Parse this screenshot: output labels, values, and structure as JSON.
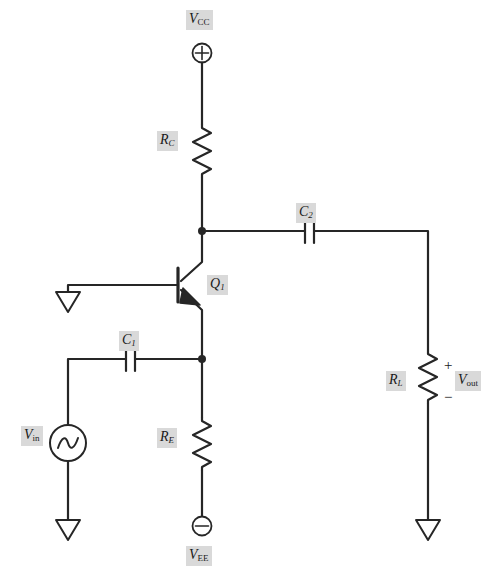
{
  "diagram": {
    "background_color": "#ffffff",
    "wire_color": "#262626",
    "label_background_color": "#d9d9d9",
    "label_text_color": "#1a1a1a"
  },
  "labels": {
    "vcc": "V",
    "vcc_sub": "CC",
    "vee": "V",
    "vee_sub": "EE",
    "vin": "V",
    "vin_sub": "in",
    "vout": "V",
    "vout_sub": "out",
    "rc": "R",
    "rc_sub": "C",
    "re": "R",
    "re_sub": "E",
    "rl": "R",
    "rl_sub": "L",
    "c1": "C",
    "c1_sub": "1",
    "c2": "C",
    "c2_sub": "2",
    "q1": "Q",
    "q1_sub": "1",
    "plus": "+",
    "minus": "−"
  },
  "components": [
    {
      "name": "vcc-terminal",
      "type": "supply-terminal-positive",
      "symbol": "circle-plus",
      "label": "V_CC",
      "x": 202,
      "y": 53
    },
    {
      "name": "resistor-rc",
      "type": "resistor",
      "label": "R_C",
      "orientation": "vertical",
      "x": 202,
      "y": 150
    },
    {
      "name": "transistor-q1",
      "type": "npn-bjt",
      "label": "Q_1",
      "x": 202,
      "y": 285
    },
    {
      "name": "capacitor-c2",
      "type": "capacitor",
      "label": "C_2",
      "orientation": "horizontal",
      "x": 310,
      "y": 231
    },
    {
      "name": "capacitor-c1",
      "type": "capacitor",
      "label": "C_1",
      "orientation": "horizontal",
      "x": 131,
      "y": 359
    },
    {
      "name": "resistor-re",
      "type": "resistor",
      "label": "R_E",
      "orientation": "vertical",
      "x": 202,
      "y": 443
    },
    {
      "name": "resistor-rl",
      "type": "resistor",
      "label": "R_L",
      "orientation": "vertical",
      "x": 428,
      "y": 385
    },
    {
      "name": "source-vin",
      "type": "ac-voltage-source",
      "label": "V_in",
      "x": 68,
      "y": 443
    },
    {
      "name": "vee-terminal",
      "type": "supply-terminal-negative",
      "symbol": "circle-minus",
      "label": "V_EE",
      "x": 202,
      "y": 526
    },
    {
      "name": "ground-base",
      "type": "ground",
      "x": 68,
      "y": 292
    },
    {
      "name": "ground-source",
      "type": "ground",
      "x": 68,
      "y": 520
    },
    {
      "name": "ground-load",
      "type": "ground",
      "x": 428,
      "y": 520
    },
    {
      "name": "node-collector",
      "type": "junction",
      "x": 202,
      "y": 231
    },
    {
      "name": "node-emitter",
      "type": "junction",
      "x": 202,
      "y": 359
    },
    {
      "name": "output-port",
      "type": "voltage-port",
      "label": "V_out",
      "polarity_top": "+",
      "polarity_bottom": "−",
      "x": 447,
      "y": 385
    }
  ]
}
